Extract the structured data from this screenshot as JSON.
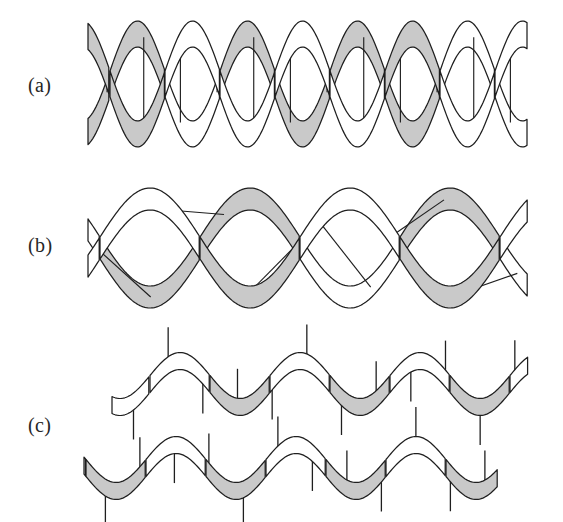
{
  "figure": {
    "background_color": "#ffffff",
    "ribbon_fill_color": "#c9c9c9",
    "stroke_color": "#1f1f1f",
    "width": 563,
    "height": 522
  },
  "panels": [
    {
      "id": "a",
      "label": "(a)",
      "label_x": 28,
      "label_y": 75,
      "description": "tightly wound double helix",
      "art": {
        "x0": 88,
        "x1": 528,
        "axis_y": 84,
        "amplitude": 50,
        "period": 110,
        "turns": 4,
        "ribbon_width": 26,
        "phase_offset": 55,
        "rung_count": 12,
        "rung_style": "vertical"
      }
    },
    {
      "id": "b",
      "label": "(b)",
      "label_x": 28,
      "label_y": 235,
      "description": "stretched partially unwound double helix",
      "art": {
        "x0": 88,
        "x1": 528,
        "axis_y": 248,
        "amplitude": 49,
        "period": 200,
        "turns": 2.2,
        "ribbon_width": 22,
        "phase_offset": 100,
        "rung_count": 6,
        "rung_style": "diagonal"
      }
    },
    {
      "id": "c",
      "label": "(c)",
      "label_x": 28,
      "label_y": 415,
      "description": "two separated single strands with unpaired bases",
      "strands": [
        {
          "name": "upper-strand",
          "x0": 112,
          "x1": 528,
          "axis_y": 384,
          "amplitude": 23,
          "period": 120,
          "ribbon_width": 17,
          "phase_offset": 30,
          "tick_count": 12,
          "tick_length": 38
        },
        {
          "name": "lower-strand",
          "x0": 84,
          "x1": 498,
          "axis_y": 468,
          "amplitude": 23,
          "period": 120,
          "ribbon_width": 17,
          "phase_offset": 26,
          "tick_count": 12,
          "tick_length": 38
        }
      ]
    }
  ]
}
